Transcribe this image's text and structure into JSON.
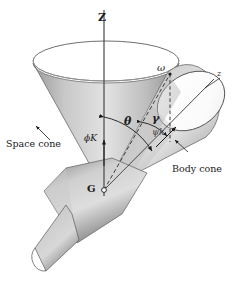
{
  "figure": {
    "background": "#ffffff",
    "ink": "#1a1a1a"
  },
  "labels": {
    "axis_Z": "Z",
    "axis_z": "z",
    "omega": "ω",
    "theta": "θ",
    "gamma": "γ",
    "phi_K": "ϕK",
    "psi_k": "ψk",
    "space_cone": "Space cone",
    "body_cone": "Body cone",
    "center_G": "G"
  },
  "elements": {
    "space_cone_name": "space-cone",
    "body_cone_name": "body-cone",
    "spacecraft_name": "spacecraft-body",
    "nozzle_name": "spacecraft-nozzle",
    "apex_marker": "apex-point-G"
  },
  "colors": {
    "cone_light": "#f2f2f2",
    "cone_mid": "#b8b8b8",
    "cone_dark": "#6f6f6f",
    "cone_shadow": "#8f8f8f",
    "outline": "#3a3a3a",
    "rim_white": "#ffffff"
  },
  "geometry": {
    "apex_G": [
      104,
      190
    ],
    "omega_tip": [
      170,
      75
    ],
    "space_cone_rim_center": [
      106,
      60
    ],
    "body_cone_rim_center": [
      191,
      100
    ],
    "Z_axis_top": [
      104,
      8
    ],
    "z_axis_end": [
      214,
      78
    ]
  }
}
